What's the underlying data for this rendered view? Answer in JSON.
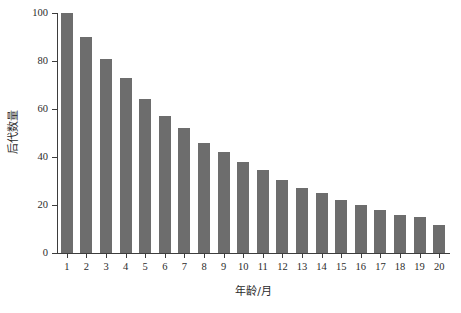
{
  "chart_data": {
    "type": "bar",
    "title": "",
    "subtitle": "",
    "xlabel": "年龄/月",
    "ylabel": "后代数量",
    "categories": [
      "1",
      "2",
      "3",
      "4",
      "5",
      "6",
      "7",
      "8",
      "9",
      "10",
      "11",
      "12",
      "13",
      "14",
      "15",
      "16",
      "17",
      "18",
      "19",
      "20"
    ],
    "values": [
      100,
      90,
      81,
      73,
      64,
      57,
      52,
      46,
      42,
      38,
      34.5,
      30.5,
      27,
      25,
      22,
      20,
      18,
      16,
      15,
      11.5
    ],
    "series": [
      {
        "name": "后代数量",
        "values": [
          100,
          90,
          81,
          73,
          64,
          57,
          52,
          46,
          42,
          38,
          34.5,
          30.5,
          27,
          25,
          22,
          20,
          18,
          16,
          15,
          11.5
        ]
      }
    ],
    "ylim": [
      0,
      100
    ],
    "y_ticks": [
      0,
      20,
      40,
      60,
      80,
      100
    ],
    "y_tick_labels": [
      "0",
      "20",
      "40",
      "60",
      "80",
      "100"
    ],
    "x_tick_labels": [
      "1",
      "2",
      "3",
      "4",
      "5",
      "6",
      "7",
      "8",
      "9",
      "10",
      "11",
      "12",
      "13",
      "14",
      "15",
      "16",
      "17",
      "18",
      "19",
      "20"
    ],
    "grid": false,
    "legend": false,
    "legend_position": "none",
    "bar_color": "#6d6d6d",
    "axis_color": "#3d3d3d",
    "background_color": "#ffffff",
    "annotations": []
  }
}
